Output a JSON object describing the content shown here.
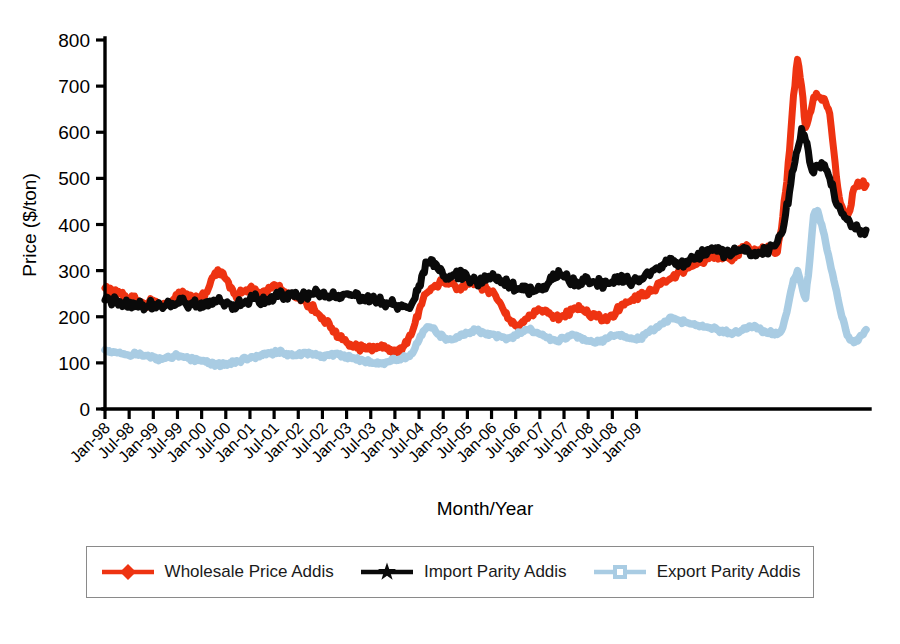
{
  "chart_data": {
    "type": "line",
    "title": "",
    "xlabel": "Month/Year",
    "ylabel": "Price ($/ton)",
    "ylim": [
      0,
      800
    ],
    "ytick_labels": [
      "0",
      "100",
      "200",
      "300",
      "400",
      "500",
      "600",
      "700",
      "800"
    ],
    "ytick_values": [
      0,
      100,
      200,
      300,
      400,
      500,
      600,
      700,
      800
    ],
    "grid": false,
    "legend_position": "bottom",
    "x_tick_labels": [
      "Jan-98",
      "Jul-98",
      "Jan-99",
      "Jul-99",
      "Jan-00",
      "Jul-00",
      "Jan-01",
      "Jul-01",
      "Jan-02",
      "Jul-02",
      "Jan-03",
      "Jul-03",
      "Jan-04",
      "Jul-04",
      "Jan-05",
      "Jul-05",
      "Jan-06",
      "Jul-06",
      "Jan-07",
      "Jul-07",
      "Jan-08",
      "Jul-08",
      "Jan-09"
    ],
    "x_start": "Jan-98",
    "x_end": "Jul-09",
    "series": [
      {
        "name": "Wholesale Price Addis",
        "color": "#EE3311",
        "marker": "diamond",
        "values": [
          262,
          255,
          258,
          248,
          252,
          246,
          240,
          244,
          236,
          228,
          226,
          232,
          236,
          230,
          224,
          228,
          232,
          238,
          244,
          250,
          246,
          240,
          238,
          242,
          246,
          252,
          268,
          288,
          302,
          297,
          282,
          262,
          250,
          246,
          252,
          258,
          262,
          256,
          250,
          248,
          252,
          262,
          270,
          266,
          258,
          252,
          248,
          244,
          240,
          236,
          230,
          224,
          216,
          206,
          198,
          188,
          176,
          166,
          158,
          150,
          144,
          140,
          136,
          134,
          132,
          130,
          130,
          131,
          133,
          132,
          130,
          129,
          128,
          130,
          134,
          142,
          160,
          186,
          214,
          238,
          252,
          262,
          268,
          272,
          276,
          278,
          272,
          266,
          262,
          266,
          272,
          276,
          272,
          268,
          264,
          260,
          254,
          246,
          232,
          214,
          196,
          186,
          180,
          182,
          188,
          196,
          204,
          210,
          214,
          212,
          208,
          204,
          200,
          198,
          202,
          208,
          214,
          218,
          216,
          212,
          208,
          204,
          200,
          198,
          196,
          198,
          204,
          212,
          220,
          226,
          232,
          238,
          242,
          246,
          250,
          254,
          258,
          264,
          270,
          276,
          280,
          286,
          292,
          298,
          302,
          306,
          310,
          314,
          318,
          322,
          326,
          330,
          332,
          330,
          328,
          326,
          330,
          336,
          344,
          352,
          348,
          342,
          338,
          344,
          350,
          348,
          344,
          340,
          390,
          470,
          560,
          680,
          758,
          700,
          610,
          640,
          676,
          678,
          670,
          664,
          640,
          560,
          480,
          440,
          420,
          430,
          478,
          492,
          488,
          486
        ]
      },
      {
        "name": "Import Parity Addis",
        "color": "#0A0A0A",
        "marker": "star",
        "values": [
          236,
          238,
          234,
          232,
          230,
          228,
          226,
          230,
          228,
          224,
          222,
          226,
          228,
          226,
          222,
          224,
          226,
          228,
          230,
          232,
          230,
          228,
          226,
          228,
          230,
          232,
          234,
          236,
          234,
          232,
          230,
          228,
          226,
          228,
          230,
          234,
          238,
          240,
          238,
          236,
          238,
          240,
          242,
          244,
          246,
          248,
          246,
          244,
          242,
          244,
          246,
          248,
          250,
          248,
          246,
          244,
          242,
          244,
          246,
          248,
          250,
          248,
          246,
          244,
          242,
          240,
          238,
          236,
          234,
          232,
          230,
          228,
          226,
          224,
          222,
          220,
          224,
          240,
          268,
          296,
          318,
          324,
          316,
          300,
          288,
          284,
          286,
          290,
          292,
          288,
          284,
          280,
          278,
          276,
          280,
          284,
          286,
          282,
          278,
          274,
          270,
          266,
          262,
          260,
          258,
          256,
          254,
          256,
          260,
          266,
          272,
          280,
          288,
          290,
          286,
          282,
          278,
          276,
          274,
          276,
          278,
          276,
          274,
          272,
          270,
          272,
          276,
          280,
          282,
          280,
          278,
          276,
          278,
          282,
          288,
          294,
          300,
          306,
          310,
          314,
          318,
          320,
          318,
          316,
          318,
          322,
          326,
          330,
          334,
          338,
          342,
          344,
          342,
          340,
          338,
          336,
          338,
          342,
          344,
          342,
          340,
          338,
          336,
          340,
          344,
          348,
          354,
          362,
          380,
          420,
          470,
          520,
          562,
          608,
          582,
          536,
          512,
          528,
          534,
          520,
          500,
          470,
          440,
          424,
          414,
          404,
          396,
          390,
          386,
          388
        ]
      },
      {
        "name": "Export Parity Addis",
        "color": "#A9CCE3",
        "marker": "square",
        "values": [
          128,
          126,
          124,
          122,
          120,
          118,
          116,
          118,
          120,
          118,
          116,
          114,
          112,
          110,
          108,
          110,
          112,
          114,
          116,
          114,
          112,
          110,
          108,
          106,
          104,
          102,
          100,
          98,
          96,
          96,
          98,
          100,
          102,
          104,
          106,
          108,
          110,
          112,
          114,
          116,
          118,
          120,
          122,
          124,
          122,
          120,
          118,
          116,
          118,
          120,
          122,
          120,
          118,
          116,
          114,
          116,
          118,
          120,
          118,
          116,
          114,
          112,
          110,
          108,
          106,
          104,
          102,
          100,
          98,
          100,
          102,
          104,
          106,
          108,
          110,
          114,
          120,
          132,
          150,
          168,
          178,
          176,
          170,
          162,
          156,
          152,
          150,
          152,
          156,
          160,
          164,
          168,
          170,
          168,
          166,
          164,
          162,
          160,
          158,
          156,
          154,
          156,
          160,
          164,
          168,
          172,
          170,
          166,
          162,
          158,
          154,
          150,
          148,
          150,
          154,
          158,
          162,
          160,
          156,
          152,
          148,
          146,
          144,
          146,
          150,
          154,
          158,
          160,
          158,
          156,
          154,
          152,
          150,
          154,
          160,
          166,
          172,
          178,
          184,
          190,
          194,
          196,
          194,
          190,
          188,
          186,
          184,
          182,
          180,
          178,
          176,
          174,
          172,
          170,
          168,
          166,
          164,
          166,
          170,
          176,
          180,
          178,
          174,
          170,
          168,
          166,
          164,
          162,
          170,
          200,
          240,
          280,
          300,
          270,
          240,
          320,
          420,
          430,
          400,
          360,
          320,
          280,
          240,
          200,
          170,
          150,
          144,
          148,
          160,
          172
        ]
      }
    ]
  },
  "axes": {
    "y_axis_title": "Price ($/ton)",
    "x_axis_title": "Month/Year"
  },
  "legend": {
    "items": [
      {
        "label": "Wholesale Price Addis",
        "color": "#EE3311",
        "marker": "diamond"
      },
      {
        "label": "Import Parity Addis",
        "color": "#0A0A0A",
        "marker": "star"
      },
      {
        "label": "Export Parity Addis",
        "color": "#A9CCE3",
        "marker": "square"
      }
    ]
  }
}
